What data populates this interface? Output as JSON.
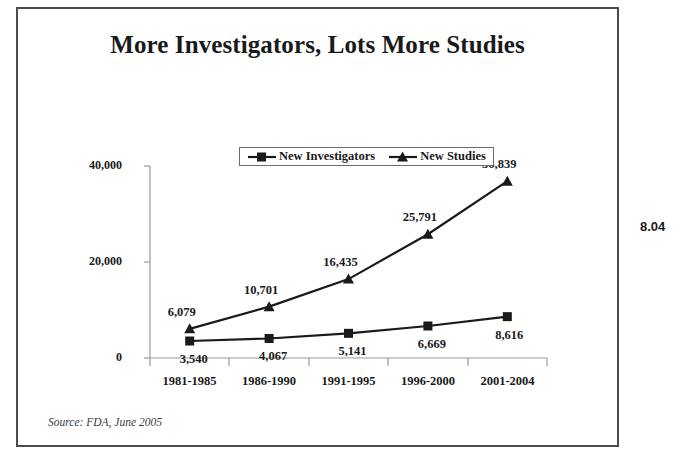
{
  "slide": {
    "title": "More Investigators, Lots More Studies",
    "source_note": "Source:  FDA, June 2005",
    "page_number": "8.04"
  },
  "legend": {
    "entries": [
      {
        "label": "New Investigators",
        "marker": "square-marker"
      },
      {
        "label": "New Studies",
        "marker": "triangle-marker"
      }
    ]
  },
  "colors": {
    "frame_border": "#4a4a50",
    "axis_line": "#9a9a9a",
    "series_line": "#1a1a1a",
    "text": "#1a1a1a"
  },
  "chart_data": {
    "type": "line",
    "title": "More Investigators, Lots More Studies",
    "xlabel": "",
    "ylabel": "",
    "categories": [
      "1981-1985",
      "1986-1990",
      "1991-1995",
      "1996-2000",
      "2001-2004"
    ],
    "series": [
      {
        "name": "New Investigators",
        "marker": "square",
        "values": [
          3540,
          4067,
          5141,
          6669,
          8616
        ],
        "labels": [
          "3,540",
          "4,067",
          "5,141",
          "6,669",
          "8,616"
        ],
        "label_positions": [
          "below",
          "below",
          "below",
          "below",
          "below"
        ]
      },
      {
        "name": "New Studies",
        "marker": "triangle",
        "values": [
          6079,
          10701,
          16435,
          25791,
          36839
        ],
        "labels": [
          "6,079",
          "10,701",
          "16,435",
          "25,791",
          "36,839"
        ],
        "label_positions": [
          "above",
          "above",
          "above",
          "above",
          "above"
        ]
      }
    ],
    "ylim": [
      0,
      40000
    ],
    "yticks": [
      0,
      20000,
      40000
    ],
    "ytick_labels": [
      "0",
      "20,000",
      "40,000"
    ],
    "grid": false,
    "legend_position": "top-center"
  }
}
